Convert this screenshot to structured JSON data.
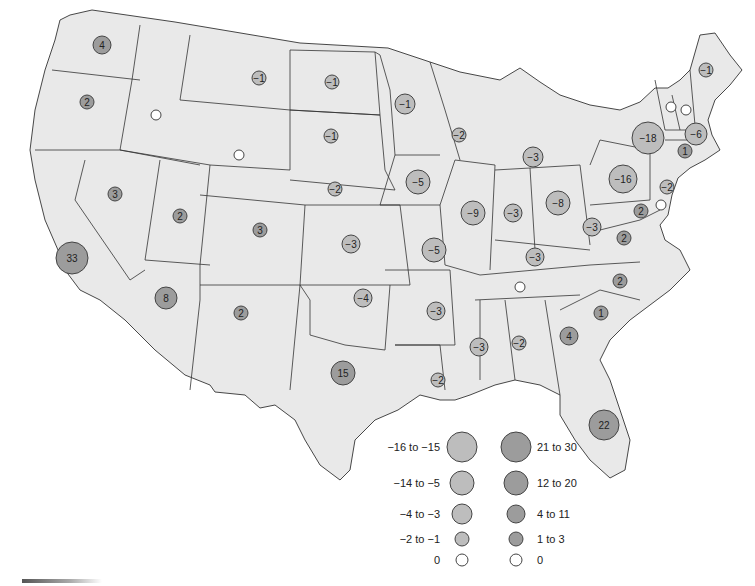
{
  "map": {
    "title": "",
    "colors": {
      "state_fill": "#e9e9e9",
      "negative_bubble": "#bdbdbd",
      "positive_bubble": "#9c9c9c",
      "zero_bubble": "#ffffff",
      "border": "#333333"
    },
    "bubbles": [
      {
        "state": "WA",
        "value": "4",
        "x": 102,
        "y": 45,
        "r": 9,
        "sign": "pos"
      },
      {
        "state": "OR",
        "value": "2",
        "x": 87,
        "y": 102,
        "r": 7,
        "sign": "pos"
      },
      {
        "state": "ID",
        "value": "0",
        "x": 156,
        "y": 115,
        "r": 5,
        "sign": "zero"
      },
      {
        "state": "MT",
        "value": "−1",
        "x": 259,
        "y": 78,
        "r": 7,
        "sign": "neg"
      },
      {
        "state": "ND",
        "value": "−1",
        "x": 332,
        "y": 82,
        "r": 7,
        "sign": "neg"
      },
      {
        "state": "SD",
        "value": "−1",
        "x": 331,
        "y": 136,
        "r": 7,
        "sign": "neg"
      },
      {
        "state": "WY",
        "value": "0",
        "x": 239,
        "y": 155,
        "r": 5,
        "sign": "zero"
      },
      {
        "state": "MN",
        "value": "−1",
        "x": 405,
        "y": 104,
        "r": 10,
        "sign": "neg"
      },
      {
        "state": "WI",
        "value": "−2",
        "x": 459,
        "y": 135,
        "r": 7,
        "sign": "neg"
      },
      {
        "state": "MI",
        "value": "−3",
        "x": 533,
        "y": 157,
        "r": 10,
        "sign": "neg"
      },
      {
        "state": "NV",
        "value": "3",
        "x": 115,
        "y": 194,
        "r": 7,
        "sign": "pos"
      },
      {
        "state": "CA",
        "value": "33",
        "x": 72,
        "y": 258,
        "r": 16,
        "sign": "pos"
      },
      {
        "state": "UT",
        "value": "2",
        "x": 180,
        "y": 216,
        "r": 7,
        "sign": "pos"
      },
      {
        "state": "CO",
        "value": "3",
        "x": 260,
        "y": 230,
        "r": 7,
        "sign": "pos"
      },
      {
        "state": "NE",
        "value": "−2",
        "x": 335,
        "y": 189,
        "r": 7,
        "sign": "neg"
      },
      {
        "state": "IA",
        "value": "−5",
        "x": 418,
        "y": 182,
        "r": 12,
        "sign": "neg"
      },
      {
        "state": "IL",
        "value": "−9",
        "x": 473,
        "y": 213,
        "r": 12,
        "sign": "neg"
      },
      {
        "state": "IN",
        "value": "−3",
        "x": 513,
        "y": 213,
        "r": 9,
        "sign": "neg"
      },
      {
        "state": "OH",
        "value": "−8",
        "x": 558,
        "y": 203,
        "r": 12,
        "sign": "neg"
      },
      {
        "state": "PA",
        "value": "−16",
        "x": 623,
        "y": 179,
        "r": 14,
        "sign": "neg"
      },
      {
        "state": "NY",
        "value": "−18",
        "x": 648,
        "y": 138,
        "r": 16,
        "sign": "neg"
      },
      {
        "state": "VT",
        "value": "0",
        "x": 671,
        "y": 107,
        "r": 5,
        "sign": "zero"
      },
      {
        "state": "NH",
        "value": "0",
        "x": 686,
        "y": 110,
        "r": 5,
        "sign": "zero"
      },
      {
        "state": "ME",
        "value": "−1",
        "x": 706,
        "y": 70,
        "r": 7,
        "sign": "neg"
      },
      {
        "state": "MA",
        "value": "−6",
        "x": 696,
        "y": 134,
        "r": 11,
        "sign": "neg"
      },
      {
        "state": "CT",
        "value": "1",
        "x": 685,
        "y": 151,
        "r": 7,
        "sign": "pos"
      },
      {
        "state": "NJ",
        "value": "−2",
        "x": 667,
        "y": 187,
        "r": 7,
        "sign": "neg"
      },
      {
        "state": "DE",
        "value": "0",
        "x": 661,
        "y": 205,
        "r": 5,
        "sign": "zero"
      },
      {
        "state": "MD",
        "value": "2",
        "x": 641,
        "y": 211,
        "r": 7,
        "sign": "pos"
      },
      {
        "state": "WV",
        "value": "−3",
        "x": 592,
        "y": 227,
        "r": 9,
        "sign": "neg"
      },
      {
        "state": "VA",
        "value": "2",
        "x": 624,
        "y": 238,
        "r": 7,
        "sign": "pos"
      },
      {
        "state": "KS",
        "value": "−3",
        "x": 351,
        "y": 244,
        "r": 9,
        "sign": "neg"
      },
      {
        "state": "MO",
        "value": "−5",
        "x": 434,
        "y": 250,
        "r": 12,
        "sign": "neg"
      },
      {
        "state": "KY",
        "value": "−3",
        "x": 535,
        "y": 257,
        "r": 9,
        "sign": "neg"
      },
      {
        "state": "TN",
        "value": "0",
        "x": 520,
        "y": 287,
        "r": 5,
        "sign": "zero"
      },
      {
        "state": "NC",
        "value": "2",
        "x": 620,
        "y": 281,
        "r": 7,
        "sign": "pos"
      },
      {
        "state": "SC",
        "value": "1",
        "x": 601,
        "y": 313,
        "r": 7,
        "sign": "pos"
      },
      {
        "state": "AZ",
        "value": "8",
        "x": 166,
        "y": 298,
        "r": 11,
        "sign": "pos"
      },
      {
        "state": "NM",
        "value": "2",
        "x": 241,
        "y": 313,
        "r": 7,
        "sign": "pos"
      },
      {
        "state": "OK",
        "value": "−4",
        "x": 363,
        "y": 298,
        "r": 9,
        "sign": "neg"
      },
      {
        "state": "AR",
        "value": "−3",
        "x": 436,
        "y": 311,
        "r": 9,
        "sign": "neg"
      },
      {
        "state": "MS",
        "value": "−3",
        "x": 479,
        "y": 347,
        "r": 9,
        "sign": "neg"
      },
      {
        "state": "AL",
        "value": "−2",
        "x": 519,
        "y": 343,
        "r": 7,
        "sign": "neg"
      },
      {
        "state": "GA",
        "value": "4",
        "x": 569,
        "y": 336,
        "r": 9,
        "sign": "pos"
      },
      {
        "state": "TX",
        "value": "15",
        "x": 343,
        "y": 373,
        "r": 12,
        "sign": "pos"
      },
      {
        "state": "LA",
        "value": "−2",
        "x": 438,
        "y": 380,
        "r": 7,
        "sign": "neg"
      },
      {
        "state": "FL",
        "value": "22",
        "x": 604,
        "y": 425,
        "r": 15,
        "sign": "pos"
      }
    ]
  },
  "legend": {
    "negative": [
      {
        "label": "−16 to −15",
        "r": 15
      },
      {
        "label": "−14 to −5",
        "r": 12
      },
      {
        "label": "−4 to −3",
        "r": 10
      },
      {
        "label": "−2 to −1",
        "r": 7
      },
      {
        "label": "0",
        "r": 6
      }
    ],
    "positive": [
      {
        "label": "21 to 30",
        "r": 15
      },
      {
        "label": "12 to 20",
        "r": 12
      },
      {
        "label": "4 to 11",
        "r": 9
      },
      {
        "label": "1 to 3",
        "r": 7
      },
      {
        "label": "0",
        "r": 6
      }
    ]
  }
}
